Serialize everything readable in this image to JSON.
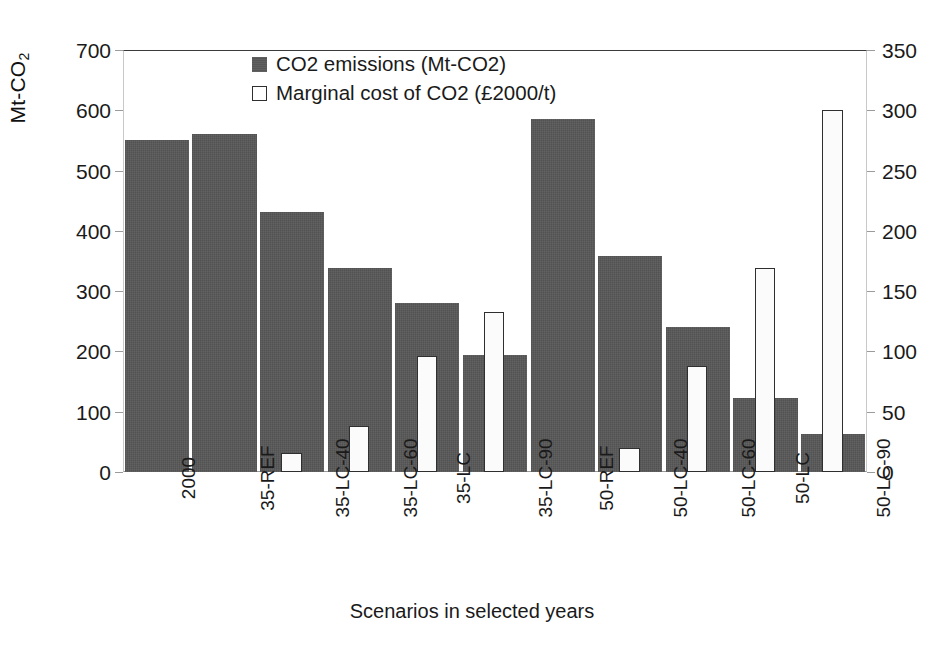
{
  "chart_data": {
    "type": "bar",
    "title": "",
    "xlabel": "Scenarios in selected years",
    "ylabel": "Mt-CO2",
    "ylabel_main": "Mt-CO",
    "ylabel_sub": "2",
    "y2label": "",
    "grid": false,
    "legend_position": "top-center",
    "categories": [
      "2000",
      "35-REF",
      "35-LC-40",
      "35-LC-60",
      "35-LC",
      "35-LC-90",
      "50-REF",
      "50-LC-40",
      "50-LC-60",
      "50-LC",
      "50-LC-90"
    ],
    "ylim": [
      0,
      700
    ],
    "y2lim": [
      0,
      350
    ],
    "yticks": [
      700,
      600,
      500,
      400,
      300,
      200,
      100,
      0
    ],
    "y2ticks": [
      350,
      300,
      250,
      200,
      150,
      100,
      50,
      0
    ],
    "series": [
      {
        "name": "CO2 emissions (Mt-CO2)",
        "axis": "left",
        "color": "#565656",
        "style": "filled",
        "values": [
          551,
          561,
          431,
          338,
          280,
          194,
          585,
          358,
          240,
          123,
          63
        ]
      },
      {
        "name": "Marginal cost of CO2 (£2000/t)",
        "axis": "right",
        "color": "#ffffff",
        "style": "outline",
        "values": [
          null,
          null,
          16,
          38,
          96,
          133,
          null,
          20,
          88,
          169,
          300
        ]
      }
    ]
  },
  "legend": {
    "items": [
      {
        "label": "CO2 emissions (Mt-CO2)",
        "swatch": "filled-gray-square"
      },
      {
        "label": "Marginal cost of CO2 (£2000/t)",
        "swatch": "outline-white-square"
      }
    ]
  },
  "axes": {
    "x_title": "Scenarios in selected years",
    "y_left_title": "Mt-CO2"
  }
}
